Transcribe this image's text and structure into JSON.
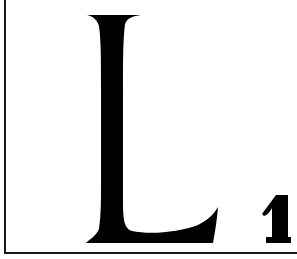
{
  "tile": {
    "letter": "L",
    "points": "1",
    "colors": {
      "background": "#ffffff",
      "ink": "#000000",
      "border": "#1a1a1a"
    }
  }
}
